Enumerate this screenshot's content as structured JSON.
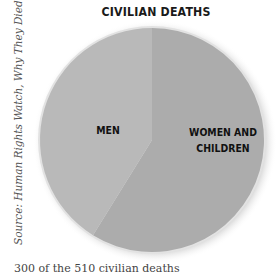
{
  "chart_data": {
    "type": "pie",
    "title": "CIVILIAN DEATHS",
    "categories": [
      "MEN",
      "WOMEN AND CHILDREN"
    ],
    "values": [
      210,
      300
    ],
    "total": 510,
    "units": "civilian deaths",
    "start_angle_deg": 0,
    "direction": "clockwise from top, Women and Children first",
    "colors": {
      "MEN": "#b9b9b9",
      "WOMEN AND CHILDREN": "#acacac"
    },
    "legend": "none (labels inside slices)",
    "source": "Source: Human Rights Watch, Why They Died, 2007",
    "caption": "300 of the 510 civilian deaths"
  },
  "title": "CIVILIAN DEATHS",
  "labels": {
    "men": "MEN",
    "women_children_line1": "WOMEN AND",
    "women_children_line2": "CHILDREN"
  },
  "source": "Source: Human Rights Watch, Why They Died, 2007",
  "caption": "300 of the 510 civilian deaths"
}
